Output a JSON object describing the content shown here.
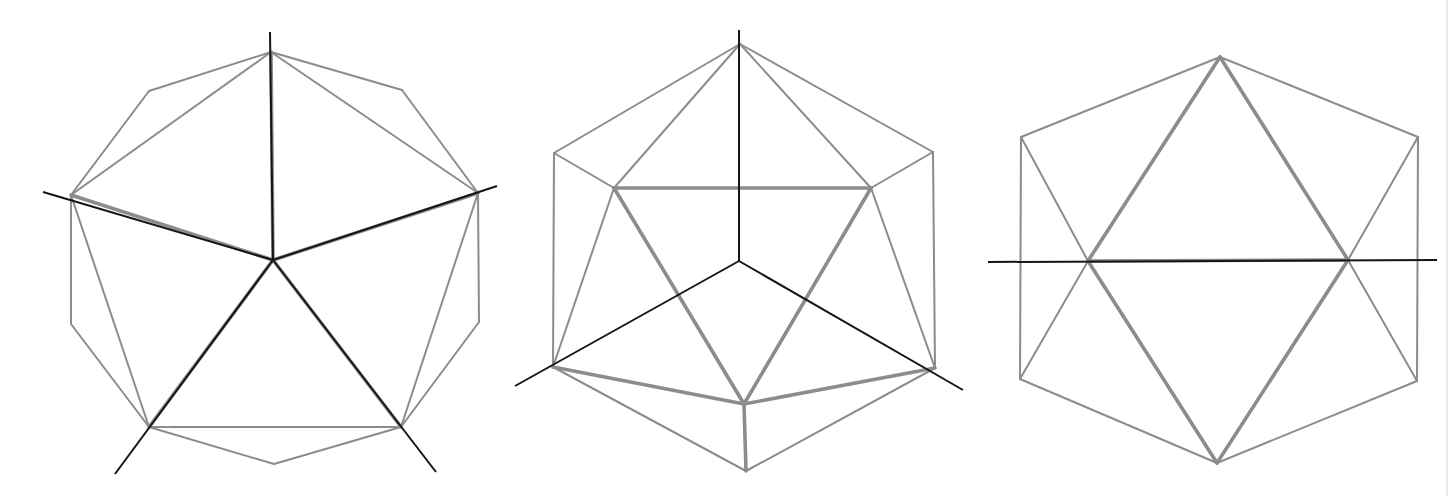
{
  "colors": {
    "background": "#ffffff",
    "edge": "#8c8c8c",
    "axis": "#151515"
  },
  "figures": [
    {
      "name": "icosahedron-fivefold-view",
      "description": "Projection along a 5-fold axis: decagon outline with five rotation axes radiating from center",
      "points": {
        "top": [
          271,
          52
        ],
        "ul": [
          149,
          91
        ],
        "ur": [
          402,
          90
        ],
        "l": [
          71,
          195
        ],
        "r": [
          478,
          193
        ],
        "ll": [
          71,
          324
        ],
        "lr": [
          479,
          322
        ],
        "bl": [
          149,
          427
        ],
        "br": [
          401,
          427
        ],
        "bottom": [
          274,
          464
        ],
        "c": [
          273,
          260
        ]
      },
      "thin_edges": [
        [
          "top",
          "ul"
        ],
        [
          "ul",
          "l"
        ],
        [
          "top",
          "l"
        ],
        [
          "top",
          "ur"
        ],
        [
          "ur",
          "r"
        ],
        [
          "top",
          "r"
        ],
        [
          "l",
          "ll"
        ],
        [
          "ll",
          "bl"
        ],
        [
          "l",
          "bl"
        ],
        [
          "r",
          "lr"
        ],
        [
          "lr",
          "br"
        ],
        [
          "r",
          "br"
        ],
        [
          "bl",
          "bottom"
        ],
        [
          "bottom",
          "br"
        ],
        [
          "bl",
          "br"
        ]
      ],
      "thick_edges": [
        [
          "c",
          "top"
        ],
        [
          "c",
          "l"
        ],
        [
          "c",
          "r"
        ],
        [
          "c",
          "bl"
        ],
        [
          "c",
          "br"
        ]
      ],
      "axes": [
        [
          [
            270,
            32
          ],
          [
            273,
            260
          ]
        ],
        [
          [
            43,
            192
          ],
          [
            273,
            260
          ]
        ],
        [
          [
            497,
            186
          ],
          [
            273,
            260
          ]
        ],
        [
          [
            115,
            474
          ],
          [
            273,
            260
          ]
        ],
        [
          [
            436,
            472
          ],
          [
            273,
            260
          ]
        ]
      ]
    },
    {
      "name": "icosahedron-threefold-view",
      "description": "Projection along a 3-fold axis: hexagonal outline with inner triangle and three axes from center",
      "points": {
        "top": [
          740,
          44
        ],
        "ul": [
          554,
          153
        ],
        "ur": [
          933,
          152
        ],
        "il": [
          614,
          188
        ],
        "ir": [
          871,
          188
        ],
        "ll": [
          553,
          367
        ],
        "lr": [
          935,
          368
        ],
        "ib": [
          744,
          404
        ],
        "bottom": [
          746,
          471
        ],
        "c": [
          739,
          261
        ]
      },
      "thin_edges": [
        [
          "top",
          "ul"
        ],
        [
          "top",
          "ur"
        ],
        [
          "top",
          "il"
        ],
        [
          "top",
          "ir"
        ],
        [
          "ul",
          "ll"
        ],
        [
          "ur",
          "lr"
        ],
        [
          "ul",
          "il"
        ],
        [
          "ur",
          "ir"
        ],
        [
          "ll",
          "il"
        ],
        [
          "lr",
          "ir"
        ],
        [
          "ll",
          "bottom"
        ],
        [
          "lr",
          "bottom"
        ]
      ],
      "thick_edges": [
        [
          "il",
          "ir"
        ],
        [
          "il",
          "ib"
        ],
        [
          "ir",
          "ib"
        ],
        [
          "ll",
          "ib"
        ],
        [
          "lr",
          "ib"
        ],
        [
          "ib",
          "bottom"
        ]
      ],
      "axes": [
        [
          [
            739,
            30
          ],
          [
            739,
            261
          ]
        ],
        [
          [
            515,
            386
          ],
          [
            739,
            261
          ]
        ],
        [
          [
            963,
            390
          ],
          [
            739,
            261
          ]
        ]
      ]
    },
    {
      "name": "icosahedron-twofold-view",
      "description": "Projection along a 2-fold axis: hexagonal outline with crossing triangles and a horizontal axis",
      "points": {
        "top": [
          1220,
          57
        ],
        "ul": [
          1021,
          137
        ],
        "ur": [
          1418,
          137
        ],
        "ml": [
          1088,
          261
        ],
        "mr": [
          1348,
          260
        ],
        "ll": [
          1020,
          379
        ],
        "lr": [
          1417,
          381
        ],
        "bottom": [
          1217,
          463
        ]
      },
      "thin_edges": [
        [
          "top",
          "ul"
        ],
        [
          "top",
          "ur"
        ],
        [
          "ul",
          "ll"
        ],
        [
          "ur",
          "lr"
        ],
        [
          "ll",
          "bottom"
        ],
        [
          "lr",
          "bottom"
        ],
        [
          "ul",
          "ml"
        ],
        [
          "ur",
          "mr"
        ],
        [
          "ll",
          "ml"
        ],
        [
          "lr",
          "mr"
        ]
      ],
      "thick_edges": [
        [
          "top",
          "ml"
        ],
        [
          "top",
          "mr"
        ],
        [
          "bottom",
          "ml"
        ],
        [
          "bottom",
          "mr"
        ],
        [
          "ml",
          "mr"
        ]
      ],
      "axes": [
        [
          [
            988,
            262
          ],
          [
            1437,
            260
          ]
        ]
      ]
    }
  ]
}
